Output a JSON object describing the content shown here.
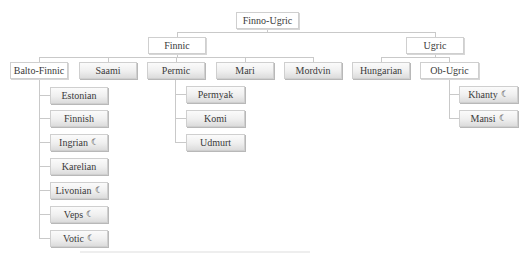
{
  "diagram": {
    "title": "Finno-Ugric",
    "marker_icon": "crescent-moon-icon",
    "marker_glyph": "☾",
    "colors": {
      "line": "#c9c9c9",
      "box_border": "#cfcfcf",
      "text": "#3a3a3a"
    },
    "nodes": {
      "root": {
        "label": "Finno-Ugric"
      },
      "finnic": {
        "label": "Finnic"
      },
      "ugric": {
        "label": "Ugric"
      },
      "balto_finnic": {
        "label": "Balto-Finnic"
      },
      "saami": {
        "label": "Saami"
      },
      "permic": {
        "label": "Permic"
      },
      "mari": {
        "label": "Mari"
      },
      "mordvin": {
        "label": "Mordvin"
      },
      "hungarian": {
        "label": "Hungarian"
      },
      "ob_ugric": {
        "label": "Ob-Ugric"
      },
      "estonian": {
        "label": "Estonian",
        "marked": false
      },
      "finnish": {
        "label": "Finnish",
        "marked": false
      },
      "ingrian": {
        "label": "Ingrian",
        "marked": true
      },
      "karelian": {
        "label": "Karelian",
        "marked": false
      },
      "livonian": {
        "label": "Livonian",
        "marked": true
      },
      "veps": {
        "label": "Veps",
        "marked": true
      },
      "votic": {
        "label": "Votic",
        "marked": true
      },
      "permyak": {
        "label": "Permyak",
        "marked": false
      },
      "komi": {
        "label": "Komi",
        "marked": false
      },
      "udmurt": {
        "label": "Udmurt",
        "marked": false
      },
      "khanty": {
        "label": "Khanty",
        "marked": true
      },
      "mansi": {
        "label": "Mansi",
        "marked": true
      }
    }
  }
}
